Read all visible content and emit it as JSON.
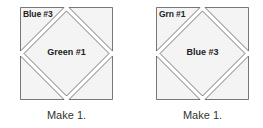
{
  "blocks": [
    {
      "corner_label": "Blue #3",
      "center_label": "Green #1",
      "caption": "Make 1."
    },
    {
      "corner_label": "Grn #1",
      "center_label": "Blue #3",
      "caption": "Make 1."
    }
  ],
  "colors": {
    "outline": "#555555",
    "fill": "#f4f4f4",
    "text": "#222222"
  }
}
